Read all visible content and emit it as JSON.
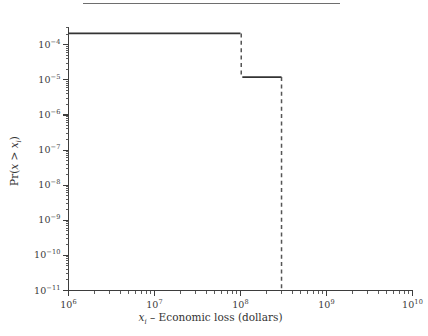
{
  "figure": {
    "top_rule": "horizontal-rule",
    "background_color": "#ffffff",
    "line_color": "#333333",
    "dash_color": "#555555",
    "axis_color": "#3d3d3d"
  },
  "axis_titles": {
    "x_prefix": "x",
    "x_subscript": "i",
    "x_rest": " – Economic loss (dollars)",
    "y_prefix": "Pr(",
    "y_var": "x",
    "y_mid": " > ",
    "y_var2": "x",
    "y_subscript": "i",
    "y_suffix": ")"
  },
  "x_tick_labels": [
    {
      "mantissa": "10",
      "exponent": "6"
    },
    {
      "mantissa": "10",
      "exponent": "7"
    },
    {
      "mantissa": "10",
      "exponent": "8"
    },
    {
      "mantissa": "10",
      "exponent": "9"
    },
    {
      "mantissa": "10",
      "exponent": "10"
    }
  ],
  "y_tick_labels": [
    {
      "mantissa": "10",
      "exponent": "−4"
    },
    {
      "mantissa": "10",
      "exponent": "−5"
    },
    {
      "mantissa": "10",
      "exponent": "−6"
    },
    {
      "mantissa": "10",
      "exponent": "−7"
    },
    {
      "mantissa": "10",
      "exponent": "−8"
    },
    {
      "mantissa": "10",
      "exponent": "−9"
    },
    {
      "mantissa": "10",
      "exponent": "−10"
    },
    {
      "mantissa": "10",
      "exponent": "−11"
    }
  ],
  "chart_data": {
    "type": "line",
    "title": "",
    "subtitle": "",
    "xlabel": "x_i – Economic loss (dollars)",
    "ylabel": "Pr(x > x_i)",
    "xscale": "log",
    "yscale": "log",
    "xlim": [
      1000000.0,
      10000000000.0
    ],
    "ylim": [
      1e-11,
      0.00032
    ],
    "grid": false,
    "legend": null,
    "x_ticks": [
      1000000.0,
      10000000.0,
      100000000.0,
      1000000000.0,
      10000000000.0
    ],
    "x_tick_labels": [
      "10^6",
      "10^7",
      "10^8",
      "10^9",
      "10^10"
    ],
    "y_ticks": [
      0.0001,
      1e-05,
      1e-06,
      1e-07,
      1e-08,
      1e-09,
      1e-10,
      1e-11
    ],
    "y_tick_labels": [
      "10^-4",
      "10^-5",
      "10^-6",
      "10^-7",
      "10^-8",
      "10^-9",
      "10^-10",
      "10^-11"
    ],
    "minor_ticks": true,
    "tick_direction": "out",
    "series": [
      {
        "name": "exceedance probability (step)",
        "style": "solid",
        "points": [
          {
            "x": 1000000.0,
            "y": 0.00021
          },
          {
            "x": 100000000.0,
            "y": 0.00021
          }
        ]
      },
      {
        "name": "exceedance probability (step)",
        "style": "solid",
        "points": [
          {
            "x": 105000000.0,
            "y": 1.2e-05
          },
          {
            "x": 300000000.0,
            "y": 1.2e-05
          }
        ]
      }
    ],
    "drops": [
      {
        "name": "drop-at-1e8",
        "style": "dashed",
        "x": 102000000.0,
        "y_from": 0.00021,
        "y_to": 1.2e-05
      },
      {
        "name": "drop-at-3e8",
        "style": "dashed",
        "x": 300000000.0,
        "y_from": 1.2e-05,
        "y_to": 1e-11
      }
    ]
  }
}
